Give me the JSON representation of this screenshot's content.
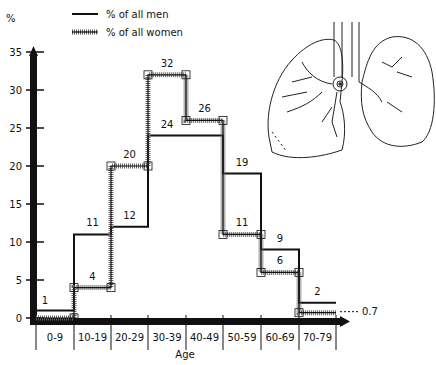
{
  "chart_data": {
    "type": "line",
    "subtype": "step",
    "title": "",
    "xlabel": "Age",
    "ylabel": "%",
    "ylim": [
      0,
      35
    ],
    "yticks": [
      0,
      5,
      10,
      15,
      20,
      25,
      30,
      35
    ],
    "categories": [
      "0-9",
      "10-19",
      "20-29",
      "30-39",
      "40-49",
      "50-59",
      "60-69",
      "70-79"
    ],
    "series": [
      {
        "name": "% of all men",
        "style": "solid",
        "values": [
          1,
          11,
          12,
          24,
          24,
          19,
          9,
          2
        ],
        "labels": [
          "1",
          "11",
          "12",
          "24",
          "",
          "19",
          "9",
          "2"
        ]
      },
      {
        "name": "% of all women",
        "style": "hatched",
        "values": [
          0,
          4,
          20,
          32,
          26,
          11,
          6,
          0.7
        ],
        "labels": [
          "",
          "4",
          "20",
          "32",
          "26",
          "11",
          "6",
          "0.7"
        ]
      }
    ],
    "legend": {
      "position": "top-left",
      "entries": [
        "% of all men",
        "% of all women"
      ]
    },
    "grid": false,
    "annotations": [
      "lung illustration (top right)",
      "0.7 callout with dashed leader line"
    ]
  },
  "legend": {
    "men": "% of all men",
    "women": "% of all women"
  },
  "axis": {
    "y_unit": "%",
    "x_title": "Age"
  }
}
